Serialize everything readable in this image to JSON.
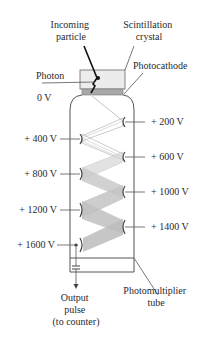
{
  "diagram": {
    "title_labels": {
      "incoming_particle": [
        "Incoming",
        "particle"
      ],
      "scintillation_crystal": [
        "Scintillation",
        "crystal"
      ],
      "photocathode": "Photocathode",
      "photon": "Photon",
      "cathode_voltage": "0 V",
      "photomultiplier_tube": [
        "Photomultiplier",
        "tube"
      ],
      "output_pulse": [
        "Output",
        "pulse",
        "(to counter)"
      ]
    },
    "dynodes_left": [
      {
        "label": "+ 400 V",
        "y": 139
      },
      {
        "label": "+ 800 V",
        "y": 174
      },
      {
        "label": "+ 1200 V",
        "y": 210
      },
      {
        "label": "+ 1600 V",
        "y": 245
      }
    ],
    "dynodes_right": [
      {
        "label": "+ 200 V",
        "y": 122
      },
      {
        "label": "+ 600 V",
        "y": 157
      },
      {
        "label": "+ 1000 V",
        "y": 192
      },
      {
        "label": "+ 1400 V",
        "y": 227
      }
    ],
    "colors": {
      "outline": "#555555",
      "crystal_fill": "#e8e8e8",
      "photocathode_fill": "#a8a8a8",
      "electron_beam": "#b0b0b0",
      "particle_track": "#111111",
      "text": "#2a2a2a"
    }
  }
}
